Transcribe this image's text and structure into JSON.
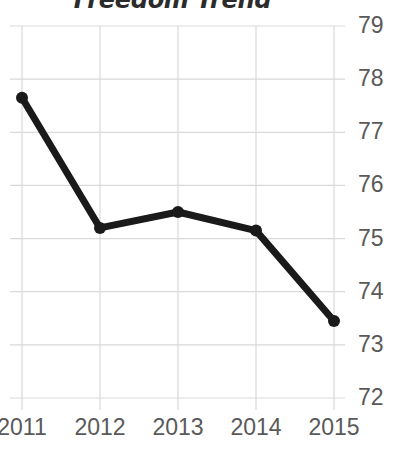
{
  "chart_data": {
    "type": "line",
    "title": "Freedom Trend",
    "xlabel": "",
    "ylabel": "",
    "categories": [
      "2011",
      "2012",
      "2013",
      "2014",
      "2015"
    ],
    "x": [
      2011,
      2012,
      2013,
      2014,
      2015
    ],
    "values": [
      77.65,
      75.2,
      75.5,
      75.15,
      73.45
    ],
    "series": [
      {
        "name": "Freedom Trend",
        "values": [
          77.65,
          75.2,
          75.5,
          75.15,
          73.45
        ]
      }
    ],
    "ylim": [
      72,
      79
    ],
    "y_ticks": [
      79,
      78,
      77,
      76,
      75,
      74,
      73,
      72
    ],
    "y_tick_labels": [
      "79",
      "78",
      "77",
      "76",
      "75",
      "74",
      "73",
      "72"
    ],
    "x_tick_labels": [
      "2011",
      "2012",
      "2013",
      "2014",
      "2015"
    ],
    "grid": true,
    "grid_color": "#d9d9d9",
    "legend": false,
    "legend_position": "none",
    "y_axis_position": "right",
    "line_color": "#1a1a1a",
    "marker": "circle",
    "marker_color": "#1a1a1a",
    "title_color": "#2b2b2b",
    "tick_label_color": "#595959",
    "background_color": "#ffffff",
    "annotations": []
  }
}
